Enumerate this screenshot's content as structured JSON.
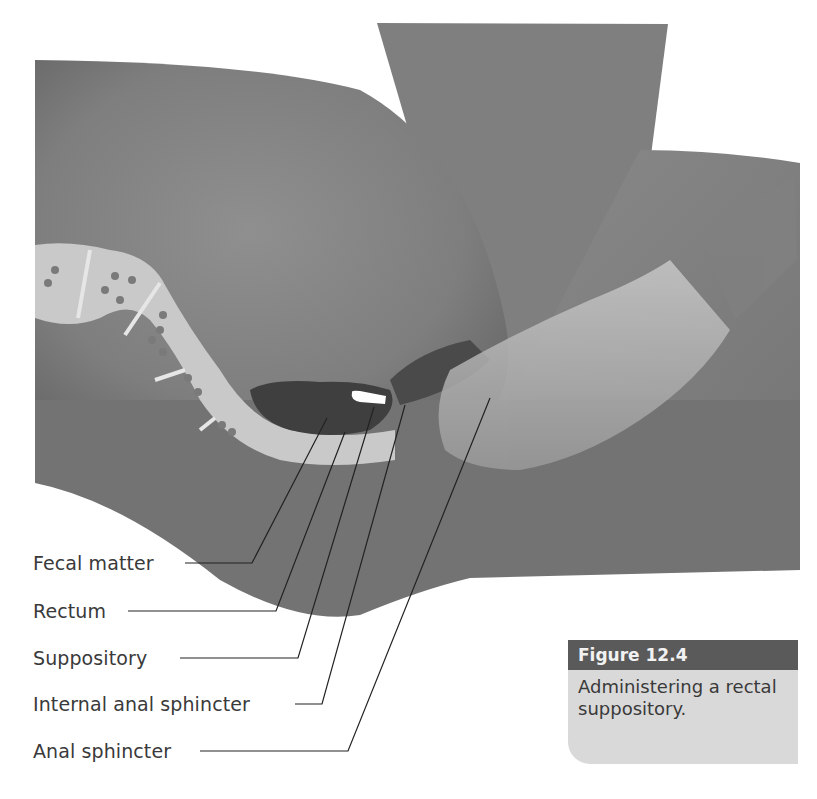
{
  "figure": {
    "number_label": "Figure 12.4",
    "caption": "Administering a rectal suppository.",
    "header_color": "#5a5a5a",
    "body_color": "#d9d9d9"
  },
  "illustration": {
    "description": "Cross-section of buttocks showing rectum with fecal matter and a gloved hand inserting a suppository",
    "elements": [
      "buttock",
      "thigh",
      "colon",
      "rectum",
      "fecal-matter",
      "suppository",
      "gloved-hand",
      "sphincters"
    ]
  },
  "labels": [
    {
      "text": "Fecal matter"
    },
    {
      "text": "Rectum"
    },
    {
      "text": "Suppository"
    },
    {
      "text": "Internal anal sphincter"
    },
    {
      "text": "Anal sphincter"
    }
  ]
}
